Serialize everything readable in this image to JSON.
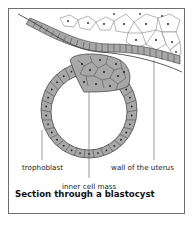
{
  "figure": {
    "caption": "Section through a blastocyst",
    "labels": {
      "trophoblast": "trophoblast",
      "inner_cell_mass": "inner cell mass",
      "uterus_wall": "wall of the uterus"
    },
    "colors": {
      "cell_fill": "#a8a8a8",
      "cell_outline": "#3a3a3a",
      "nucleus": "#222222",
      "frame": "#6e6e6e",
      "leader_line": "#555555"
    }
  }
}
